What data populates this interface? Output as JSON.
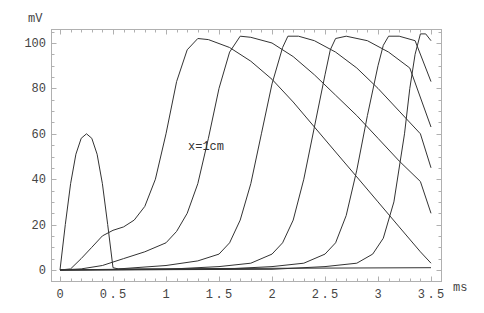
{
  "chart_data": {
    "type": "line",
    "title": "",
    "xlabel": "ms",
    "ylabel": "mV",
    "xlim": [
      0,
      3.5
    ],
    "ylim": [
      0,
      105
    ],
    "grid": false,
    "legend": null,
    "x_ticks": [
      "0",
      "0.5",
      "1",
      "1.5",
      "2",
      "2.5",
      "3",
      "3.5"
    ],
    "y_ticks": [
      "0",
      "20",
      "40",
      "60",
      "80",
      "100"
    ],
    "annotations": [
      {
        "text": "x=1cm",
        "x": 1.2,
        "y": 70
      }
    ],
    "series": [
      {
        "name": "x=0 (stimulus)",
        "points": [
          [
            0,
            0
          ],
          [
            0.05,
            20
          ],
          [
            0.1,
            38
          ],
          [
            0.15,
            51
          ],
          [
            0.2,
            58
          ],
          [
            0.25,
            60
          ],
          [
            0.3,
            58
          ],
          [
            0.35,
            51
          ],
          [
            0.4,
            38
          ],
          [
            0.45,
            20
          ],
          [
            0.5,
            1
          ],
          [
            0.55,
            0.5
          ],
          [
            3.5,
            1
          ]
        ]
      },
      {
        "name": "x=1cm",
        "points": [
          [
            0,
            0
          ],
          [
            0.1,
            0.5
          ],
          [
            0.2,
            5
          ],
          [
            0.3,
            10
          ],
          [
            0.4,
            15
          ],
          [
            0.5,
            17.5
          ],
          [
            0.6,
            19
          ],
          [
            0.7,
            22
          ],
          [
            0.8,
            28
          ],
          [
            0.9,
            40
          ],
          [
            1.0,
            60
          ],
          [
            1.1,
            83
          ],
          [
            1.2,
            97
          ],
          [
            1.3,
            102
          ],
          [
            1.4,
            101.5
          ],
          [
            1.6,
            98
          ],
          [
            1.8,
            92
          ],
          [
            2.0,
            84
          ],
          [
            2.2,
            74
          ],
          [
            2.4,
            63
          ],
          [
            2.6,
            52
          ],
          [
            2.8,
            41
          ],
          [
            3.0,
            30
          ],
          [
            3.2,
            19
          ],
          [
            3.4,
            8
          ],
          [
            3.5,
            3
          ]
        ]
      },
      {
        "name": "x=2cm",
        "points": [
          [
            0,
            0
          ],
          [
            0.2,
            0.5
          ],
          [
            0.4,
            2
          ],
          [
            0.6,
            5
          ],
          [
            0.8,
            8
          ],
          [
            1.0,
            12
          ],
          [
            1.1,
            17
          ],
          [
            1.2,
            25
          ],
          [
            1.3,
            38
          ],
          [
            1.4,
            58
          ],
          [
            1.5,
            80
          ],
          [
            1.6,
            96
          ],
          [
            1.7,
            103
          ],
          [
            1.8,
            102.5
          ],
          [
            2.0,
            100
          ],
          [
            2.2,
            94
          ],
          [
            2.4,
            86
          ],
          [
            2.6,
            77
          ],
          [
            2.8,
            68
          ],
          [
            3.0,
            58
          ],
          [
            3.2,
            48
          ],
          [
            3.4,
            39
          ],
          [
            3.5,
            25
          ]
        ]
      },
      {
        "name": "x=3cm",
        "points": [
          [
            0,
            0
          ],
          [
            0.5,
            0.3
          ],
          [
            1.0,
            2
          ],
          [
            1.3,
            4
          ],
          [
            1.5,
            7
          ],
          [
            1.6,
            12
          ],
          [
            1.7,
            22
          ],
          [
            1.8,
            38
          ],
          [
            1.9,
            60
          ],
          [
            2.0,
            82
          ],
          [
            2.1,
            98
          ],
          [
            2.15,
            103
          ],
          [
            2.25,
            103
          ],
          [
            2.4,
            101
          ],
          [
            2.6,
            96
          ],
          [
            2.8,
            89
          ],
          [
            3.0,
            80
          ],
          [
            3.2,
            70
          ],
          [
            3.4,
            60
          ],
          [
            3.5,
            45
          ]
        ]
      },
      {
        "name": "x=4cm",
        "points": [
          [
            0,
            0
          ],
          [
            1.0,
            0.3
          ],
          [
            1.5,
            1.5
          ],
          [
            1.8,
            3
          ],
          [
            2.0,
            7
          ],
          [
            2.1,
            12
          ],
          [
            2.2,
            22
          ],
          [
            2.3,
            40
          ],
          [
            2.4,
            63
          ],
          [
            2.5,
            86
          ],
          [
            2.55,
            97
          ],
          [
            2.6,
            102
          ],
          [
            2.7,
            103
          ],
          [
            2.9,
            101
          ],
          [
            3.1,
            96
          ],
          [
            3.3,
            89
          ],
          [
            3.5,
            63
          ]
        ]
      },
      {
        "name": "x=5cm",
        "points": [
          [
            0,
            0
          ],
          [
            1.5,
            0.3
          ],
          [
            2.0,
            1.5
          ],
          [
            2.3,
            3
          ],
          [
            2.5,
            7
          ],
          [
            2.6,
            12
          ],
          [
            2.7,
            24
          ],
          [
            2.8,
            44
          ],
          [
            2.9,
            68
          ],
          [
            3.0,
            90
          ],
          [
            3.05,
            99
          ],
          [
            3.1,
            103
          ],
          [
            3.2,
            103
          ],
          [
            3.35,
            101
          ],
          [
            3.5,
            83
          ]
        ]
      },
      {
        "name": "x=6cm",
        "points": [
          [
            0,
            0
          ],
          [
            2.0,
            0.3
          ],
          [
            2.5,
            1.5
          ],
          [
            2.8,
            3
          ],
          [
            2.95,
            7
          ],
          [
            3.05,
            14
          ],
          [
            3.15,
            30
          ],
          [
            3.25,
            60
          ],
          [
            3.3,
            80
          ],
          [
            3.35,
            95
          ],
          [
            3.4,
            104
          ],
          [
            3.45,
            104
          ],
          [
            3.5,
            101
          ]
        ]
      }
    ]
  }
}
